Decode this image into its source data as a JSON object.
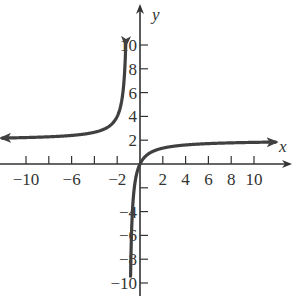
{
  "chart_data": {
    "type": "line",
    "title": "",
    "xlabel": "x",
    "ylabel": "y",
    "xlim": [
      -12,
      13
    ],
    "ylim": [
      -11,
      11
    ],
    "grid": false,
    "legend": null,
    "x_ticks": [
      -10,
      -8,
      -6,
      -4,
      -2,
      2,
      4,
      6,
      8,
      10
    ],
    "x_tick_labels": [
      "-10",
      "-6",
      "-2",
      "2",
      "4",
      "6",
      "8",
      "10"
    ],
    "x_tick_labels_at": [
      -10,
      -6,
      -2,
      2,
      4,
      6,
      8,
      10
    ],
    "y_ticks": [
      -10,
      -8,
      -6,
      -4,
      -2,
      2,
      4,
      6,
      8,
      10
    ],
    "y_tick_labels": [
      "10",
      "8",
      "6",
      "4",
      "2",
      "-4",
      "-6",
      "-8",
      "-10"
    ],
    "y_tick_labels_at": [
      10,
      8,
      6,
      4,
      2,
      -4,
      -6,
      -8,
      -10
    ],
    "series": [
      {
        "name": "y = 2x/(x+1)",
        "branch": "left",
        "x": [
          -12,
          -10,
          -8,
          -6,
          -4,
          -3,
          -2,
          -1.6,
          -1.4,
          -1.25
        ],
        "values": [
          2.18,
          2.22,
          2.29,
          2.4,
          2.67,
          3.0,
          4.0,
          5.33,
          7.0,
          10.0
        ]
      },
      {
        "name": "y = 2x/(x+1)",
        "branch": "right",
        "x": [
          -0.83,
          -0.75,
          -0.6,
          -0.5,
          -0.3,
          0,
          1,
          2,
          4,
          6,
          8,
          10,
          12
        ],
        "values": [
          -9.8,
          -6.0,
          -3.0,
          -2.0,
          -0.86,
          0,
          1.0,
          1.33,
          1.6,
          1.71,
          1.78,
          1.82,
          1.85
        ]
      }
    ],
    "asymptotes": {
      "vertical": -1,
      "horizontal": 2
    },
    "colors": {
      "curve": "#404040",
      "axis": "#333333"
    }
  }
}
